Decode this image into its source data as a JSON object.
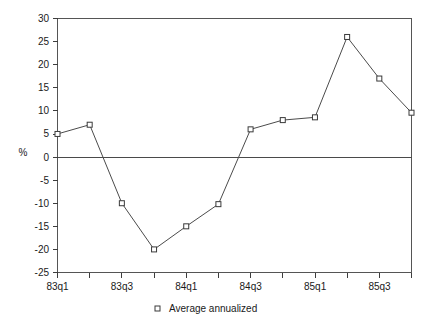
{
  "chart_data": {
    "type": "line",
    "title": "",
    "xlabel": "",
    "ylabel": "%",
    "x": [
      "83q1",
      "83q2",
      "83q3",
      "83q4",
      "84q1",
      "84q2",
      "84q3",
      "84q4",
      "85q1",
      "85q2",
      "85q3",
      "85q4"
    ],
    "categories": [
      "83q1",
      "83q2",
      "83q3",
      "83q4",
      "84q1",
      "84q2",
      "84q3",
      "84q4",
      "85q1",
      "85q2",
      "85q3",
      "85q4"
    ],
    "series": [
      {
        "name": "Average annualized",
        "values": [
          5,
          7,
          -10,
          -20,
          -15,
          -10.2,
          6,
          8,
          8.6,
          26,
          17,
          9.6
        ]
      }
    ],
    "values": [
      5,
      7,
      -10,
      -20,
      -15,
      -10.2,
      6,
      8,
      8.6,
      26,
      17,
      9.6
    ],
    "ylim": [
      -25,
      30
    ],
    "y_ticks": [
      30,
      25,
      20,
      15,
      10,
      5,
      0,
      -5,
      -10,
      -15,
      -20,
      -25
    ],
    "y_tick_labels": [
      "30",
      "25",
      "20",
      "15",
      "10",
      "5",
      "0",
      "-5",
      "-10",
      "-15",
      "-20",
      "-25"
    ],
    "x_tick_labels": [
      "83q1",
      "83q3",
      "84q1",
      "84q3",
      "85q1",
      "85q3"
    ],
    "x_labeled_indices": [
      0,
      2,
      4,
      6,
      8,
      10
    ],
    "grid": false,
    "zero_line": true,
    "legend_position": "bottom-center",
    "legend": [
      "Average annualized"
    ],
    "marker_style": "open-square",
    "line_color": "#4b4b4b",
    "marker_fill": "#ffffff",
    "marker_stroke": "#3a3a3a"
  },
  "legend": {
    "entry_label": "Average annualized",
    "marker_name": "open-square-marker"
  },
  "axes": {
    "y_axis_title": "%"
  }
}
